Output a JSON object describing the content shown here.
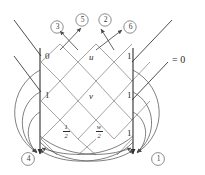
{
  "figure": {
    "equation_label": "= 0",
    "nodes": [
      {
        "id": "n-top-left",
        "label": "0",
        "x": 47,
        "y": 57,
        "kind": "plain"
      },
      {
        "id": "n-top-mid",
        "label": "u",
        "x": 92,
        "y": 58,
        "kind": "italic"
      },
      {
        "id": "n-top-right",
        "label": "1",
        "x": 129,
        "y": 57,
        "kind": "plain"
      },
      {
        "id": "n-mid-left",
        "label": "1",
        "x": 47,
        "y": 96,
        "kind": "plain"
      },
      {
        "id": "n-mid-mid",
        "label": "v",
        "x": 92,
        "y": 97,
        "kind": "italic"
      },
      {
        "id": "n-mid-right",
        "label": "1",
        "x": 129,
        "y": 96,
        "kind": "plain"
      },
      {
        "id": "n-bot-right",
        "label": "1",
        "x": 129,
        "y": 134,
        "kind": "plain"
      }
    ],
    "fraction_nodes": [
      {
        "id": "n-bot-left",
        "numerator": "1",
        "denominator": "2",
        "x": 64,
        "y": 130
      },
      {
        "id": "n-bot-mid",
        "numerator": "w",
        "denominator": "2",
        "x": 97,
        "y": 130
      }
    ],
    "circled_top": [
      {
        "id": "c3",
        "label": "3",
        "x": 51,
        "y": 21
      },
      {
        "id": "c5",
        "label": "5",
        "x": 76,
        "y": 14
      },
      {
        "id": "c2",
        "label": "2",
        "x": 99,
        "y": 14
      },
      {
        "id": "c6",
        "label": "6",
        "x": 124,
        "y": 21
      }
    ],
    "circled_bottom": [
      {
        "id": "c4",
        "label": "4",
        "x": 22,
        "y": 153
      },
      {
        "id": "c1",
        "label": "1",
        "x": 152,
        "y": 153
      }
    ],
    "colors": {
      "lattice_line": "#8c8c8c",
      "dark_line": "#3a3a3a",
      "curve_line": "#555555",
      "text": "#2b2b2b",
      "background": "#ffffff"
    }
  }
}
